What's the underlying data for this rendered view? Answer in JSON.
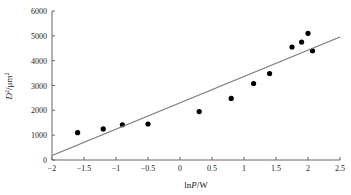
{
  "chart_data": {
    "type": "scatter",
    "title": "",
    "xlabel": "lnP/W",
    "ylabel": "D²/μm²",
    "xlim": [
      -2,
      2.5
    ],
    "ylim": [
      0,
      6000
    ],
    "xticks": [
      -2,
      -1.5,
      -1,
      -0.5,
      0,
      0.5,
      1,
      1.5,
      2,
      2.5
    ],
    "xtick_labels": [
      "−2",
      "−1.5",
      "−1",
      "−0.5",
      "0",
      "0.5",
      "1",
      "1.5",
      "2",
      "2.5"
    ],
    "yticks": [
      0,
      1000,
      2000,
      3000,
      4000,
      5000,
      6000
    ],
    "ytick_labels": [
      "0",
      "1000",
      "2000",
      "3000",
      "4000",
      "5000",
      "6000"
    ],
    "grid": false,
    "legend": null,
    "series": [
      {
        "name": "measured",
        "marker": "circle",
        "color": "#000000",
        "x": [
          -1.6,
          -1.2,
          -0.9,
          -0.5,
          0.3,
          0.8,
          1.15,
          1.4,
          1.75,
          1.9,
          2.0,
          2.07
        ],
        "y": [
          1100,
          1250,
          1420,
          1450,
          1950,
          2480,
          3080,
          3480,
          4550,
          4750,
          5100,
          4400
        ]
      },
      {
        "name": "linear fit",
        "type": "line",
        "color": "#777777",
        "x": [
          -2,
          2.5
        ],
        "y": [
          180,
          4950
        ]
      }
    ]
  }
}
